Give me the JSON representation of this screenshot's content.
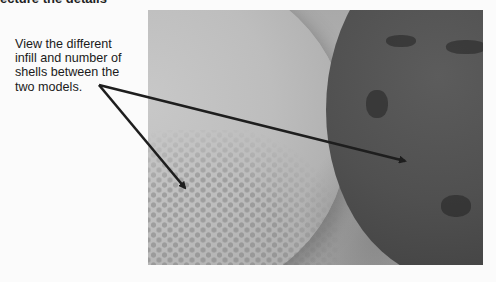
{
  "document": {
    "top_cropped_text": "ecture the details",
    "caption": "View the different infill and number of shells between the two models.",
    "caption_lines": [
      "View the different",
      "infill and number of",
      "shells between the",
      "two models."
    ],
    "figure": {
      "description": "Photo of two 3D-printed models: light model with honeycomb infill (left), dark model with sparse irregular infill (right)",
      "annotations": [
        {
          "label": "arrow-to-light-model",
          "from": [
            99,
            85
          ],
          "to": [
            187,
            190
          ]
        },
        {
          "label": "arrow-to-dark-model",
          "from": [
            99,
            85
          ],
          "to": [
            407,
            162
          ]
        }
      ]
    }
  },
  "colors": {
    "page_background": "#fbfbfb",
    "text": "#1a1a1a",
    "arrow": "#1e1e1e",
    "light_model": "#c0c0c0",
    "dark_model": "#4f4f4f"
  }
}
